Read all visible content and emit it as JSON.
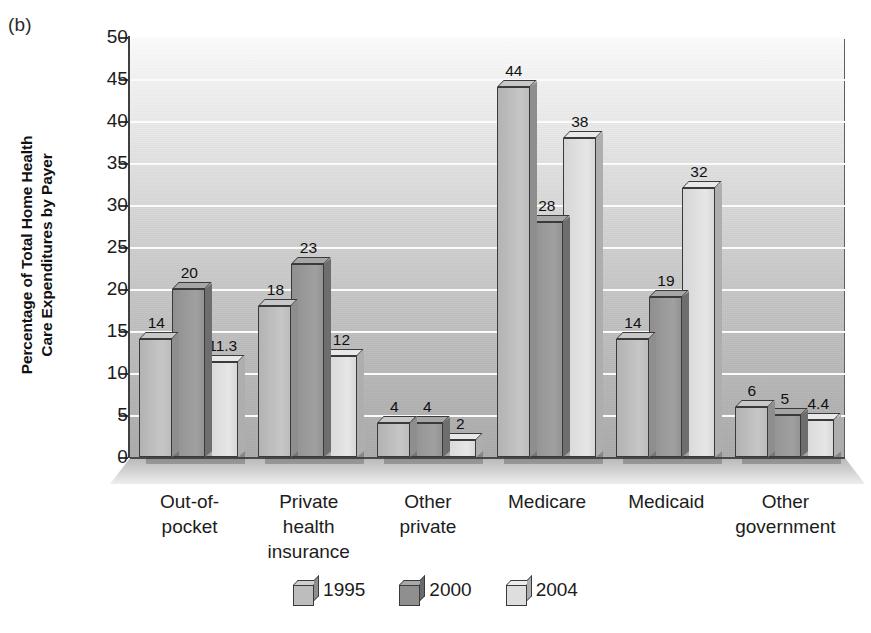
{
  "panel_label": "(b)",
  "chart_data": {
    "type": "bar",
    "title": "",
    "ylabel_lines": [
      "Percentage of Total Home Health",
      "Care Expenditures by Payer"
    ],
    "ylabel": "Percentage of Total Home Health Care Expenditures by Payer",
    "xlabel": "",
    "ylim": [
      0,
      50
    ],
    "ytick_labels": [
      "50",
      "45",
      "40",
      "35",
      "30",
      "25",
      "20",
      "15",
      "10",
      "5",
      "0"
    ],
    "ytick_values": [
      50,
      45,
      40,
      35,
      30,
      25,
      20,
      15,
      10,
      5,
      0
    ],
    "grid": true,
    "legend_position": "bottom-center",
    "categories": [
      "Out-of-\npocket",
      "Private\nhealth\ninsurance",
      "Other\nprivate",
      "Medicare",
      "Medicaid",
      "Other\ngovernment"
    ],
    "series": [
      {
        "name": "1995",
        "color": "#bdbdbd",
        "values": [
          14,
          18,
          4,
          44,
          14,
          6
        ],
        "value_labels": [
          "14",
          "18",
          "4",
          "44",
          "14",
          "6"
        ]
      },
      {
        "name": "2000",
        "color": "#8f8f8f",
        "values": [
          20,
          23,
          4,
          28,
          19,
          5
        ],
        "value_labels": [
          "20",
          "23",
          "4",
          "28",
          "19",
          "5"
        ]
      },
      {
        "name": "2004",
        "color": "#dedede",
        "values": [
          11.3,
          12,
          2,
          38,
          32,
          4.4
        ],
        "value_labels": [
          "11.3",
          "12",
          "2",
          "38",
          "32",
          "4.4"
        ]
      }
    ]
  }
}
